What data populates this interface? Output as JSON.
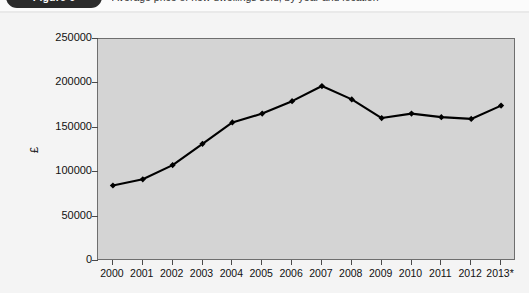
{
  "figure": {
    "badge_label": "Figure 6",
    "caption": "Average price of new dwellings sold, by year and location"
  },
  "colors": {
    "plot_background": "#d4d4d4",
    "page_background": "#f4f4f4",
    "line": "#000000",
    "marker": "#000000",
    "axis": "#6e6e6e",
    "badge": "#2b2b2b"
  },
  "chart_data": {
    "type": "line",
    "title": "",
    "xlabel": "",
    "ylabel": "£",
    "ylim": [
      0,
      250000
    ],
    "yticks": [
      0,
      50000,
      100000,
      150000,
      200000,
      250000
    ],
    "ytick_labels": [
      "0",
      "50000",
      "100000",
      "150000",
      "200000",
      "250000"
    ],
    "grid": false,
    "legend": "none",
    "categories": [
      "2000",
      "2001",
      "2002",
      "2003",
      "2004",
      "2005",
      "2006",
      "2007",
      "2008",
      "2009",
      "2010",
      "2011",
      "2012",
      "2013*"
    ],
    "x": [
      "2000",
      "2001",
      "2002",
      "2003",
      "2004",
      "2005",
      "2006",
      "2007",
      "2008",
      "2009",
      "2010",
      "2011",
      "2012",
      "2013*"
    ],
    "series": [
      {
        "name": "Average price",
        "values": [
          85000,
          92000,
          108000,
          132000,
          156000,
          166000,
          180000,
          197000,
          182000,
          161000,
          166000,
          162000,
          160000,
          175000
        ]
      }
    ],
    "footnote_marker": "*",
    "markers": "diamond"
  }
}
